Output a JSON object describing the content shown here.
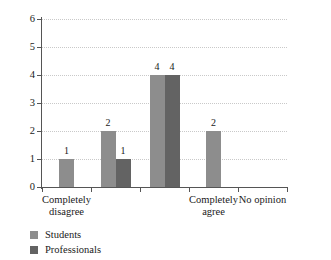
{
  "chart_data": {
    "type": "bar",
    "title": "",
    "xlabel": "",
    "ylabel": "",
    "ylim": [
      0,
      6
    ],
    "yticks": [
      "0",
      "1",
      "2",
      "3",
      "4",
      "5",
      "6"
    ],
    "grid": true,
    "legend_position": "bottom-left",
    "categories": [
      "Completely\ndisagree",
      "",
      "",
      "Completely\nagree",
      "No opinion"
    ],
    "series": [
      {
        "name": "Students",
        "color": "#8d8d8d",
        "values": [
          1,
          2,
          4,
          2,
          0
        ],
        "labels": [
          "1",
          "2",
          "4",
          "2",
          ""
        ]
      },
      {
        "name": "Professionals",
        "color": "#636363",
        "values": [
          0,
          1,
          4,
          0,
          0
        ],
        "labels": [
          "",
          "1",
          "4",
          "",
          ""
        ]
      }
    ]
  },
  "legend": {
    "items": [
      {
        "label": "Students",
        "color": "#8d8d8d"
      },
      {
        "label": "Professionals",
        "color": "#636363"
      }
    ]
  }
}
